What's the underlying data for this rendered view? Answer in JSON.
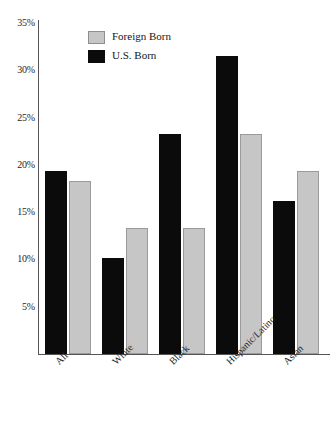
{
  "chart_data": {
    "type": "bar",
    "title": "",
    "subtitle": "",
    "xlabel": "",
    "ylabel": "",
    "categories": [
      "All",
      "White",
      "Black",
      "Hispanic/Latino",
      "Asian"
    ],
    "series": [
      {
        "name": "U.S. Born",
        "color": "#0b0b0b",
        "values": [
          19.3,
          10.1,
          23.3,
          31.5,
          16.2
        ]
      },
      {
        "name": "Foreign Born",
        "color": "#c6c6c6",
        "values": [
          18.3,
          13.3,
          13.3,
          23.3,
          19.3
        ]
      }
    ],
    "legend": [
      {
        "label": "Foreign Born",
        "swatch": "foreign",
        "color": "#c6c6c6"
      },
      {
        "label": "U.S. Born",
        "swatch": "us",
        "color": "#0b0b0b"
      }
    ],
    "legend_position": "top-left-inside",
    "ylim": [
      0,
      35
    ],
    "ytick_values": [
      35,
      30,
      25,
      20,
      15,
      10,
      5
    ],
    "ytick_labels": [
      "35%",
      "30%",
      "25%",
      "20%",
      "15%",
      "10%",
      "5%"
    ],
    "grid": false,
    "x_tick_label_rotation": -45,
    "value_unit": "percent"
  }
}
